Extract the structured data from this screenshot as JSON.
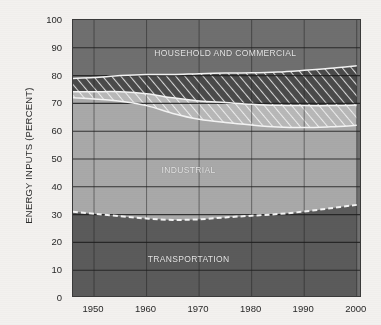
{
  "chart_data": {
    "type": "area",
    "title": "",
    "xlabel": "",
    "ylabel": "ENERGY INPUTS (PERCENT)",
    "xlim": [
      1946,
      2001
    ],
    "ylim": [
      0,
      100
    ],
    "grid": true,
    "legend_position": "inline-labels",
    "xticks": [
      1950,
      1960,
      1970,
      1980,
      1990,
      2000
    ],
    "yticks": [
      0,
      10,
      20,
      30,
      40,
      50,
      60,
      70,
      80,
      90,
      100
    ],
    "annotations": [
      {
        "text": "HOUSEHOLD AND COMMERCIAL",
        "x": 1975,
        "y": 88
      },
      {
        "text": "INDUSTRIAL",
        "x": 1968,
        "y": 46
      },
      {
        "text": "TRANSPORTATION",
        "x": 1968,
        "y": 14
      }
    ],
    "x": [
      1946,
      1950,
      1955,
      1960,
      1965,
      1970,
      1975,
      1980,
      1985,
      1990,
      1995,
      2000
    ],
    "series": [
      {
        "name": "TRANSPORTATION",
        "color": "#5b5b5b",
        "values": [
          31.0,
          30.3,
          29.4,
          28.6,
          28.1,
          28.3,
          29.0,
          29.6,
          30.2,
          31.1,
          32.3,
          33.5
        ]
      },
      {
        "name": "INDUSTRIAL",
        "color": "#a9a9a9",
        "values": [
          41.0,
          41.3,
          41.4,
          40.6,
          38.3,
          36.0,
          34.1,
          32.6,
          31.3,
          30.2,
          29.3,
          28.6
        ]
      },
      {
        "name": "INDUSTRIAL ELECTRICAL LOSSES",
        "color": "#bdbdbd",
        "hatch": "light-diagonal",
        "values": [
          2.2,
          2.6,
          3.4,
          4.3,
          5.6,
          6.6,
          7.2,
          7.5,
          7.8,
          7.9,
          7.6,
          7.3
        ]
      },
      {
        "name": "HOUSEHOLD AND COMMERCIAL ELECTRICAL LOSSES",
        "color": "#4a4a4a",
        "hatch": "dark-diagonal",
        "values": [
          4.8,
          5.1,
          5.8,
          6.9,
          8.4,
          9.8,
          10.6,
          11.3,
          12.0,
          12.7,
          13.4,
          14.1
        ]
      },
      {
        "name": "HOUSEHOLD AND COMMERCIAL",
        "color": "#6f6f6f",
        "values": [
          21.0,
          20.7,
          20.0,
          19.6,
          19.6,
          19.3,
          19.1,
          19.0,
          18.7,
          18.1,
          17.4,
          16.5
        ]
      }
    ],
    "colors": {
      "transportation": "#5b5b5b",
      "industrial": "#a9a9a9",
      "industrial_losses": "#bdbdbd",
      "household_losses": "#4a4a4a",
      "household": "#6f6f6f",
      "boundary_line": "#f4f4f4",
      "grid": "#1e1e1e",
      "frame": "#3a3a3a",
      "background": "#f3f1ef",
      "text": "#282828"
    }
  },
  "axis": {
    "ylabel": "ENERGY INPUTS (PERCENT)",
    "yticks": [
      "100",
      "90",
      "80",
      "70",
      "60",
      "50",
      "40",
      "30",
      "20",
      "10",
      "0"
    ],
    "xticks": [
      "1950",
      "1960",
      "1970",
      "1980",
      "1990",
      "2000"
    ]
  },
  "labels": {
    "household": "HOUSEHOLD AND COMMERCIAL",
    "industrial": "INDUSTRIAL",
    "transportation": "TRANSPORTATION"
  }
}
